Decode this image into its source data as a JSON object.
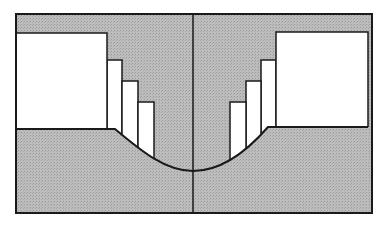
{
  "diagram": {
    "type": "symmetric-cross-section",
    "colors": {
      "background": "#ffffff",
      "shade": "#b9b9b9",
      "stroke": "#1a1a1a",
      "fill_white": "#ffffff"
    },
    "frame": {
      "x": 16,
      "y": 14,
      "w": 356,
      "h": 199
    },
    "top_band": {
      "y1": 14,
      "y2": 33
    },
    "center_line_x": 193,
    "curve_bottom_y": 171,
    "left": {
      "white_block": {
        "x": 16,
        "y": 33,
        "w": 91,
        "h": 96
      },
      "steps": [
        {
          "x": 107,
          "y": 60,
          "w": 15
        },
        {
          "x": 122,
          "y": 81,
          "w": 16
        },
        {
          "x": 138,
          "y": 102,
          "w": 16
        }
      ],
      "floor_y": 129,
      "curve_start_x": 115
    },
    "right": {
      "white_block": {
        "x": 276,
        "y": 32,
        "w": 92,
        "h": 95
      },
      "steps": [
        {
          "x": 261,
          "y": 60,
          "w": 15
        },
        {
          "x": 246,
          "y": 81,
          "w": 15
        },
        {
          "x": 230,
          "y": 102,
          "w": 16
        }
      ],
      "floor_y": 127,
      "curve_start_x": 268
    }
  }
}
